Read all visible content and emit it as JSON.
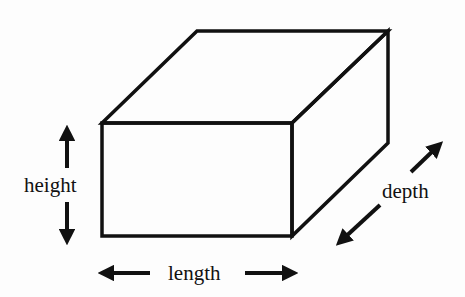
{
  "diagram": {
    "labels": {
      "height": "height",
      "length": "length",
      "depth": "depth"
    },
    "colors": {
      "background": "#fdfdfd",
      "stroke": "#111111"
    }
  }
}
